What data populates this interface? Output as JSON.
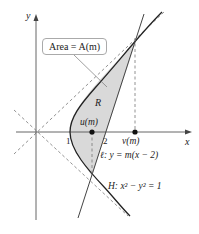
{
  "diagram": {
    "axes": {
      "x_label": "x",
      "y_label": "y"
    },
    "area_label": "Area = A(m)",
    "region_label": "R",
    "ticks": {
      "one": "1",
      "two": "2"
    },
    "points": {
      "u": "u(m)",
      "v": "v(m)"
    },
    "line_label": "ℓ: y = m(x − 2)",
    "hyperbola_label": "H: x² − y² = 1",
    "colors": {
      "region_fill": "#d9d9d9",
      "curve": "#222222",
      "axis": "#555555",
      "dashed": "#777777"
    }
  }
}
